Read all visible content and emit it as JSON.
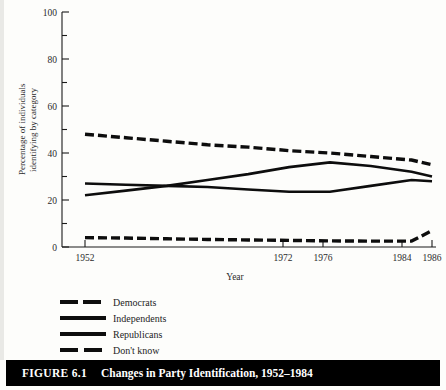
{
  "caption": {
    "number": "FIGURE 6.1",
    "text": "Changes in Party Identification, 1952–1984"
  },
  "chart_data": {
    "type": "line",
    "title": "",
    "xlabel": "Year",
    "ylabel": "Percentage of individuals identifying by category",
    "ylabel_line1": "Percentage of individuals",
    "ylabel_line2": "identifying by category",
    "xlim": [
      1952,
      1986
    ],
    "ylim": [
      0,
      100
    ],
    "yticks": [
      0,
      20,
      40,
      60,
      80,
      100
    ],
    "ytick_labels": [
      "0",
      "20",
      "40",
      "60",
      "80",
      "100"
    ],
    "yminor_step": 10,
    "xticks": [
      1952,
      1972,
      1976,
      1984,
      1986
    ],
    "xtick_labels": [
      "1952",
      "1972",
      "1976",
      "1984",
      "1986"
    ],
    "grid": false,
    "legend_position": "below-left",
    "x": [
      1952,
      1956,
      1960,
      1964,
      1968,
      1972,
      1976,
      1980,
      1984,
      1986
    ],
    "series": [
      {
        "name": "Democrats",
        "style": "dashed",
        "values": [
          48,
          46.5,
          45,
          43.5,
          42.5,
          41,
          40,
          38.5,
          37,
          35
        ]
      },
      {
        "name": "Independents",
        "style": "solid",
        "values": [
          22,
          24,
          26,
          28.5,
          31,
          34,
          36,
          34.5,
          32,
          30
        ]
      },
      {
        "name": "Republicans",
        "style": "solid",
        "values": [
          27,
          26.5,
          26,
          25.5,
          24.5,
          23.5,
          23.5,
          26,
          28.5,
          28
        ]
      },
      {
        "name": "Don't know",
        "style": "dashed",
        "values": [
          4,
          3.8,
          3.5,
          3.2,
          3,
          2.8,
          2.6,
          2.5,
          2.5,
          7
        ]
      }
    ]
  },
  "legend": {
    "items": [
      {
        "label": "Democrats",
        "style": "dashed"
      },
      {
        "label": "Independents",
        "style": "solid"
      },
      {
        "label": "Republicans",
        "style": "solid"
      },
      {
        "label": "Don't know",
        "style": "dashed"
      }
    ]
  }
}
